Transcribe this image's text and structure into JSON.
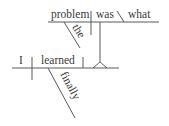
{
  "diagram": {
    "type": "sentence-diagram",
    "style": "Reed-Kellogg",
    "colors": {
      "background": "#ffffff",
      "text": "#3a3a3a",
      "lines": "#5a5a5a"
    },
    "main_clause": {
      "subject": "I",
      "verb": "learned",
      "modifiers": [
        {
          "word": "finally",
          "modifies": "learned"
        }
      ],
      "direct_object": "noun-clause"
    },
    "noun_clause": {
      "subject": "problem",
      "verb": "was",
      "complement": "what",
      "modifiers": [
        {
          "word": "the",
          "modifies": "problem"
        }
      ]
    }
  }
}
